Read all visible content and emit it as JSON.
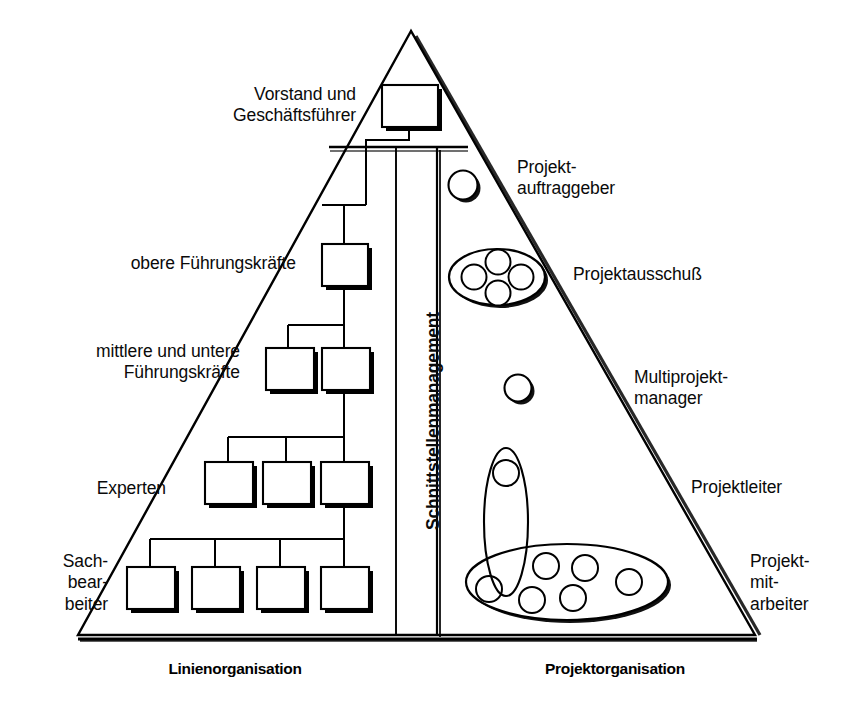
{
  "diagram": {
    "title_left_axis": "Linienorganisation",
    "title_right_axis": "Projektorganisation",
    "center_column_label": "Schnittstellenmanagement",
    "left_labels": [
      {
        "id": "vorstand",
        "text": "Vorstand und\nGeschäftsführer"
      },
      {
        "id": "obere-fk",
        "text": "obere Führungskräfte"
      },
      {
        "id": "mittlere-fk",
        "text": "mittlere und untere\nFührungskräfte"
      },
      {
        "id": "experten",
        "text": "Experten"
      },
      {
        "id": "sachbearbeiter",
        "text": "Sach-\nbear-\nbeiter"
      }
    ],
    "right_labels": [
      {
        "id": "projektauftraggeber",
        "text": "Projekt-\nauftraggeber"
      },
      {
        "id": "projektausschuss",
        "text": "Projektausschuß"
      },
      {
        "id": "multiprojektmanager",
        "text": "Multiprojekt-\nmanager"
      },
      {
        "id": "projektleiter",
        "text": "Projektleiter"
      },
      {
        "id": "projektmitarbeiter",
        "text": "Projekt-\nmit-\narbeiter"
      }
    ],
    "colors": {
      "line": "#000000",
      "shadow": "#1a1a1a",
      "background": "#ffffff",
      "text": "#0a0a0a"
    },
    "org_chart": {
      "levels": [
        {
          "level": 1,
          "name": "vorstand",
          "boxes": 1
        },
        {
          "level": 2,
          "name": "obere",
          "boxes": 1
        },
        {
          "level": 3,
          "name": "mittlere",
          "boxes": 2
        },
        {
          "level": 4,
          "name": "experten",
          "boxes": 3
        },
        {
          "level": 5,
          "name": "sachbearbeiter",
          "boxes": 4
        }
      ],
      "total_boxes": 11
    },
    "project_org": {
      "groups": [
        {
          "name": "projektauftraggeber",
          "shape": "circle",
          "members": 1
        },
        {
          "name": "projektausschuss",
          "shape": "ellipse",
          "members": 4
        },
        {
          "name": "multiprojektmanager",
          "shape": "circle",
          "members": 1
        },
        {
          "name": "projektleiter",
          "shape": "ellipse-vertical",
          "members": 1
        },
        {
          "name": "projektmitarbeiter",
          "shape": "ellipse-horizontal",
          "members": 6
        }
      ]
    }
  }
}
